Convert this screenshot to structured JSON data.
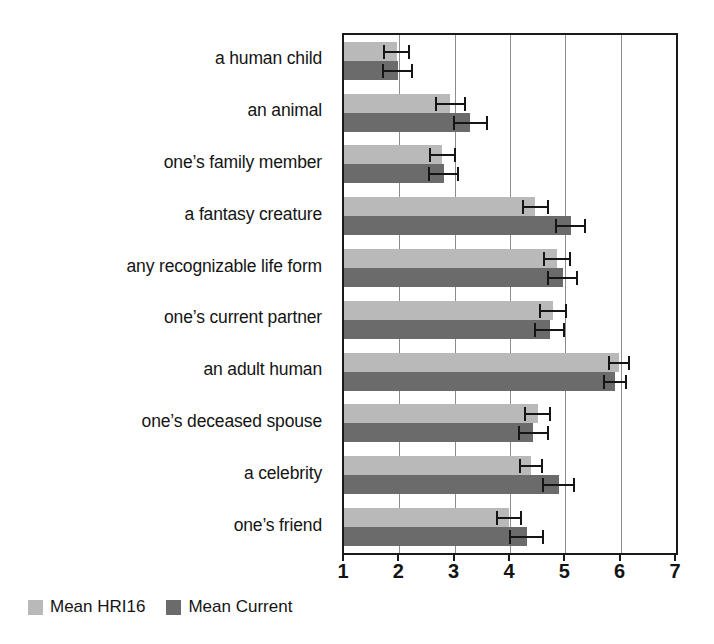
{
  "chart_data": {
    "type": "bar",
    "orientation": "horizontal",
    "title": "",
    "xlabel": "",
    "ylabel": "",
    "xlim": [
      1,
      7
    ],
    "xticks": [
      1,
      2,
      3,
      4,
      5,
      6,
      7
    ],
    "xtick_labels": [
      "1",
      "2",
      "3",
      "4",
      "5",
      "6",
      "7"
    ],
    "grid": "vertical",
    "legend_position": "below-left",
    "categories": [
      "a human child",
      "an animal",
      "one’s family member",
      "a fantasy creature",
      "any recognizable life form",
      "one’s current partner",
      "an adult human",
      "one’s deceased spouse",
      "a celebrity",
      "one’s friend"
    ],
    "series": [
      {
        "name": "Mean HRI16",
        "color": "#b9b9b9",
        "values": [
          1.95,
          2.92,
          2.78,
          4.46,
          4.85,
          4.78,
          5.97,
          4.5,
          4.38,
          3.98
        ],
        "errors": [
          0.22,
          0.26,
          0.22,
          0.22,
          0.24,
          0.24,
          0.18,
          0.22,
          0.2,
          0.22
        ]
      },
      {
        "name": "Mean Current",
        "color": "#6b6b6b",
        "values": [
          1.97,
          3.28,
          2.8,
          5.1,
          4.95,
          4.72,
          5.9,
          4.42,
          4.88,
          4.3
        ],
        "errors": [
          0.26,
          0.3,
          0.26,
          0.26,
          0.26,
          0.26,
          0.2,
          0.26,
          0.28,
          0.3
        ]
      }
    ]
  },
  "legend": {
    "entries": [
      {
        "label": "Mean HRI16",
        "swatch": "hri16"
      },
      {
        "label": "Mean Current",
        "swatch": "current"
      }
    ]
  },
  "colors": {
    "hri16": "#b9b9b9",
    "current": "#6b6b6b",
    "axis": "#1a1a1a",
    "grid": "#8d8d8d",
    "text": "#141414",
    "background": "#ffffff"
  }
}
